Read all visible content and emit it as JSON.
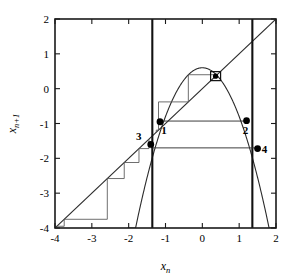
{
  "chart_data": {
    "type": "line",
    "title": "",
    "xlabel": "x_n",
    "ylabel": "x_n+1",
    "xlim": [
      -4,
      2
    ],
    "ylim": [
      -4,
      2
    ],
    "xticks": [
      -4,
      -3,
      -2,
      -1,
      0,
      1,
      2
    ],
    "xticklabels": [
      "-4",
      "-3",
      "-2",
      "-1",
      "0",
      "1",
      "2"
    ],
    "yticks": [
      -4,
      -3,
      -2,
      -1,
      0,
      1,
      2
    ],
    "yticklabels": [
      "-4",
      "-3",
      "-2",
      "-1",
      "0",
      "1",
      "2"
    ],
    "grid": false,
    "legend": null,
    "series": [
      {
        "name": "map-curve",
        "kind": "parabola",
        "description": "x_{n+1} = 0.6 - 1.4 x_n^2",
        "a": -1.4,
        "c": 0.6,
        "vertex": [
          0.0,
          0.6
        ],
        "roots": [
          -0.655,
          0.655
        ]
      },
      {
        "name": "identity-line",
        "kind": "line",
        "description": "x_{n+1} = x_n",
        "slope": 1,
        "intercept": 0,
        "points": [
          [
            -4,
            -4
          ],
          [
            2,
            2
          ]
        ]
      },
      {
        "name": "left-boundary",
        "kind": "vline",
        "x": -1.358
      },
      {
        "name": "right-boundary",
        "kind": "vline",
        "x": 1.358
      }
    ],
    "fixed_point": {
      "name": "attracting-fixed-point",
      "x": 0.36,
      "y": 0.36,
      "marker": "small-square-box"
    },
    "labeled_points": [
      {
        "label": "1",
        "x": -1.15,
        "y": -0.95
      },
      {
        "label": "2",
        "x": 1.2,
        "y": -0.92
      },
      {
        "label": "3",
        "x": -1.4,
        "y": -1.6
      },
      {
        "label": "4",
        "x": 1.5,
        "y": -1.72
      }
    ],
    "cobweb_inner": {
      "name": "converging-cobweb",
      "description": "staircase spiralling inward to the fixed point",
      "x_sequence": [
        -1.25,
        -1.19,
        -0.38,
        0.4,
        0.37,
        0.35,
        0.36,
        0.36
      ]
    },
    "cobweb_outer": {
      "name": "diverging-cobweb",
      "description": "staircase escaping to the lower left beyond the left boundary",
      "x_sequence": [
        -1.45,
        -1.72,
        -2.12,
        -2.58,
        -3.75,
        -3.95
      ]
    },
    "connector_segments": [
      {
        "name": "point1-to-point2-horizontal",
        "y": -0.93,
        "x_from": -1.15,
        "x_to": 1.2
      },
      {
        "name": "point3-to-point4-horizontal",
        "y": -1.7,
        "x_from": -1.4,
        "x_to": 1.5
      }
    ]
  },
  "axis": {
    "x_label_base": "x",
    "x_label_sub": "n",
    "y_label_base": "x",
    "y_label_sub": "n+1"
  }
}
